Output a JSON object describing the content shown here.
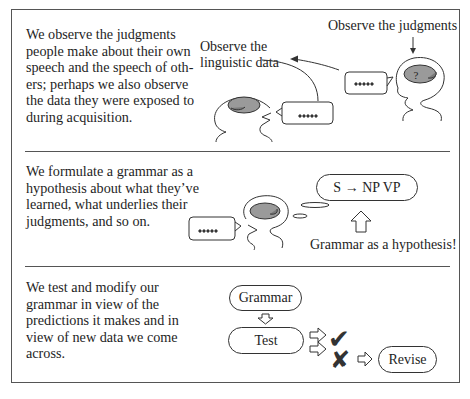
{
  "panels": [
    {
      "id": "observe",
      "description": [
        "We observe the judgments",
        "people make about their own",
        "speech and the speech of oth-",
        "ers; perhaps we also observe",
        "the data they were exposed to",
        "during acquisition."
      ],
      "labels": {
        "judgments": "Observe the judgments",
        "data_line1": "Observe the",
        "data_line2": "linguistic data"
      },
      "speech_bubble_text": "•••••",
      "brain_mark": "?"
    },
    {
      "id": "formulate",
      "description": [
        "We formulate a grammar as a",
        "hypothesis about what they’ve",
        "learned, what underlies their",
        "judgments, and so on."
      ],
      "rule": "S → NP VP",
      "caption": "Grammar as a hypothesis!",
      "speech_bubble_text": "•••••"
    },
    {
      "id": "test",
      "description": [
        "We test and modify our",
        "grammar in view of the",
        "predictions it makes and in",
        "view of new data we come",
        "across."
      ],
      "flow": {
        "grammar": "Grammar",
        "test": "Test",
        "pass_icon": "✔",
        "fail_icon": "✘",
        "revise": "Revise"
      }
    }
  ],
  "colors": {
    "line": "#333333",
    "brain_fill": "#9a9a9a",
    "text": "#1e1e1e"
  }
}
